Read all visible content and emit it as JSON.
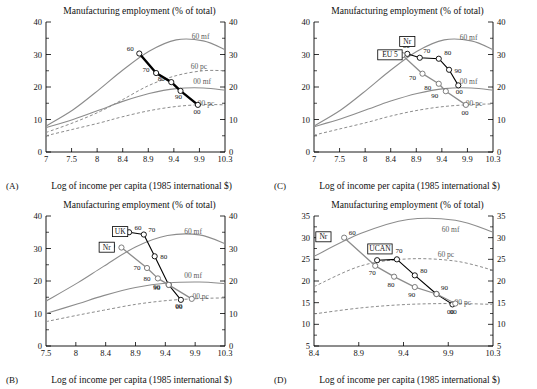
{
  "figure": {
    "panels": [
      {
        "id": "(A)",
        "title": "Manufacturing employment (% of total)",
        "xlabel": "Log of income per capita (1985 international $)",
        "xticks": [
          "7",
          "7.5",
          "8",
          "8.4",
          "8.9",
          "9.4",
          "9.9",
          "10.3"
        ],
        "yticks": [
          "0",
          "10",
          "20",
          "30",
          "40"
        ],
        "curve_labels": [
          "60 mf",
          "60 pc",
          "00 mf",
          "00 pc"
        ],
        "series_labels": [],
        "point_labels": [
          "60",
          "70",
          "80",
          "90",
          "00"
        ]
      },
      {
        "id": "(B)",
        "title": "Manufacturing employment (% of total)",
        "xlabel": "Log of income per capita (1985 international $)",
        "xticks": [
          "7.5",
          "8",
          "8.4",
          "8.9",
          "9.4",
          "9.9",
          "10.3"
        ],
        "yticks": [
          "0",
          "10",
          "20",
          "30",
          "40"
        ],
        "curve_labels": [
          "60 mf",
          "00 mf",
          "00 pc"
        ],
        "series_labels": [
          "UK",
          "Nr"
        ],
        "point_labels": [
          "60",
          "70",
          "80",
          "90",
          "00"
        ]
      },
      {
        "id": "(C)",
        "title": "Manufacturing employment (% of total)",
        "xlabel": "Log of income per capita (1985 international $)",
        "xticks": [
          "7",
          "7.5",
          "8",
          "8.4",
          "8.9",
          "9.4",
          "9.9",
          "10.3"
        ],
        "yticks": [
          "0",
          "10",
          "20",
          "30",
          "40"
        ],
        "curve_labels": [
          "60 mf",
          "00 mf",
          "00 pc"
        ],
        "series_labels": [
          "Nr",
          "EU 5"
        ],
        "point_labels": [
          "60",
          "70",
          "80",
          "90",
          "00"
        ]
      },
      {
        "id": "(D)",
        "title": "Manufacturing employment (% of total)",
        "xlabel": "Log of income per capita (1985 international $)",
        "xticks": [
          "8.4",
          "8.9",
          "9.4",
          "9.9",
          "10.3"
        ],
        "yticks": [
          "5",
          "10",
          "15",
          "20",
          "25",
          "30",
          "35"
        ],
        "curve_labels": [
          "60 mf",
          "60 pc",
          "00 pc"
        ],
        "series_labels": [
          "Nr",
          "UCAN"
        ],
        "point_labels": [
          "60",
          "70",
          "80",
          "90",
          "00"
        ]
      }
    ]
  },
  "chart_data": [
    {
      "type": "line",
      "panel": "(A)",
      "title": "Manufacturing employment (% of total)",
      "xlabel": "Log of income per capita (1985 international $)",
      "ylabel": "Manufacturing employment (% of total)",
      "xlim": [
        7,
        10.3
      ],
      "ylim": [
        0,
        40
      ],
      "grid": false,
      "legend": "inline-curve-labels",
      "reference_curves": [
        {
          "name": "60 mf",
          "style": "solid",
          "x": [
            7,
            7.5,
            8,
            8.4,
            8.9,
            9.4,
            9.9,
            10.3
          ],
          "y": [
            8.0,
            13.0,
            19.5,
            25.0,
            31.0,
            34.5,
            34.2,
            31.5
          ]
        },
        {
          "name": "60 pc",
          "style": "dashed",
          "x": [
            7,
            7.5,
            8,
            8.4,
            8.9,
            9.4,
            9.9,
            10.3
          ],
          "y": [
            6.0,
            9.0,
            12.5,
            16.0,
            20.5,
            23.5,
            25.0,
            25.0
          ]
        },
        {
          "name": "00 mf",
          "style": "solid",
          "x": [
            7,
            7.5,
            8,
            8.4,
            8.9,
            9.4,
            9.9,
            10.3
          ],
          "y": [
            7.5,
            10.0,
            13.0,
            15.5,
            18.0,
            19.5,
            19.7,
            19.0
          ]
        },
        {
          "name": "00 pc",
          "style": "dashed",
          "x": [
            7,
            7.5,
            8,
            8.4,
            8.9,
            9.4,
            9.9,
            10.3
          ],
          "y": [
            5.0,
            7.0,
            9.0,
            10.8,
            12.7,
            14.0,
            14.6,
            14.5
          ]
        }
      ],
      "series": [
        {
          "name": "main",
          "style": "thick-black",
          "x": [
            8.72,
            9.03,
            9.31,
            9.48,
            9.8
          ],
          "y": [
            30.3,
            24.3,
            21.5,
            18.8,
            14.5
          ],
          "labels": [
            "60",
            "70",
            "80",
            "90",
            "00"
          ]
        }
      ]
    },
    {
      "type": "line",
      "panel": "(B)",
      "title": "Manufacturing employment (% of total)",
      "xlabel": "Log of income per capita (1985 international $)",
      "ylabel": "Manufacturing employment (% of total)",
      "xlim": [
        7.5,
        10.3
      ],
      "ylim": [
        0,
        40
      ],
      "grid": false,
      "legend": "inline-curve-labels",
      "reference_curves": [
        {
          "name": "60 mf",
          "style": "solid",
          "x": [
            7.5,
            8,
            8.4,
            8.9,
            9.4,
            9.9,
            10.3
          ],
          "y": [
            13.8,
            19.5,
            24.5,
            30.5,
            34.0,
            34.2,
            31.5
          ]
        },
        {
          "name": "00 mf",
          "style": "solid",
          "x": [
            7.5,
            8,
            8.4,
            8.9,
            9.4,
            9.9,
            10.3
          ],
          "y": [
            10.0,
            13.0,
            15.5,
            18.0,
            19.4,
            19.7,
            19.2
          ]
        },
        {
          "name": "00 pc",
          "style": "dashed",
          "x": [
            7.5,
            8,
            8.4,
            8.9,
            9.4,
            9.9,
            10.3
          ],
          "y": [
            7.5,
            9.5,
            11.0,
            12.8,
            14.0,
            14.6,
            14.8
          ]
        }
      ],
      "series": [
        {
          "name": "UK",
          "style": "thick-black",
          "x": [
            8.8,
            9.03,
            9.2,
            9.42,
            9.61
          ],
          "y": [
            35.0,
            34.3,
            27.6,
            18.8,
            14.2
          ],
          "labels": [
            "60",
            "70",
            "80",
            "90",
            "00"
          ]
        },
        {
          "name": "Nr",
          "style": "gray",
          "x": [
            8.68,
            9.08,
            9.25,
            9.42,
            9.78
          ],
          "y": [
            30.3,
            24.0,
            20.8,
            18.8,
            14.5
          ],
          "labels": [
            "60",
            "70",
            "80",
            "90",
            "00"
          ]
        }
      ]
    },
    {
      "type": "line",
      "panel": "(C)",
      "title": "Manufacturing employment (% of total)",
      "xlabel": "Log of income per capita (1985 international $)",
      "ylabel": "Manufacturing employment (% of total)",
      "xlim": [
        7,
        10.3
      ],
      "ylim": [
        0,
        40
      ],
      "grid": false,
      "legend": "inline-curve-labels",
      "reference_curves": [
        {
          "name": "60 mf",
          "style": "solid",
          "x": [
            7,
            7.5,
            8,
            8.4,
            8.9,
            9.4,
            9.9,
            10.3
          ],
          "y": [
            8.0,
            13.0,
            19.5,
            25.0,
            31.0,
            34.5,
            34.2,
            31.5
          ]
        },
        {
          "name": "00 mf",
          "style": "solid",
          "x": [
            7,
            7.5,
            8,
            8.4,
            8.9,
            9.4,
            9.9,
            10.3
          ],
          "y": [
            7.8,
            10.2,
            13.2,
            15.6,
            18.0,
            19.5,
            19.7,
            19.0
          ]
        },
        {
          "name": "00 pc",
          "style": "dashed",
          "x": [
            7,
            7.5,
            8,
            8.4,
            8.9,
            9.4,
            9.9,
            10.3
          ],
          "y": [
            5.2,
            7.2,
            9.2,
            11.0,
            12.8,
            14.0,
            14.6,
            14.8
          ]
        }
      ],
      "series": [
        {
          "name": "Nr",
          "style": "thick-black",
          "x": [
            8.72,
            8.95,
            9.3,
            9.49,
            9.66
          ],
          "y": [
            30.2,
            29.0,
            28.7,
            25.3,
            20.5
          ],
          "labels": [
            "60",
            "70",
            "80",
            "90",
            "00"
          ]
        },
        {
          "name": "EU 5",
          "style": "gray",
          "x": [
            8.63,
            9.0,
            9.3,
            9.43,
            9.8
          ],
          "y": [
            29.8,
            24.1,
            21.0,
            18.7,
            14.5
          ],
          "labels": [
            "60",
            "70",
            "80",
            "90",
            "00"
          ]
        }
      ]
    },
    {
      "type": "line",
      "panel": "(D)",
      "title": "Manufacturing employment (% of total)",
      "xlabel": "Log of income per capita (1985 international $)",
      "ylabel": "Manufacturing employment (% of total)",
      "xlim": [
        8.4,
        10.3
      ],
      "ylim": [
        5,
        35
      ],
      "grid": false,
      "legend": "inline-curve-labels",
      "reference_curves": [
        {
          "name": "60 mf",
          "style": "solid",
          "x": [
            8.4,
            8.9,
            9.4,
            9.9,
            10.3
          ],
          "y": [
            25.7,
            31.0,
            34.2,
            34.0,
            31.3
          ]
        },
        {
          "name": "60 pc",
          "style": "dashed",
          "x": [
            8.4,
            8.9,
            9.4,
            9.9,
            10.3
          ],
          "y": [
            18.7,
            23.5,
            25.1,
            24.6,
            22.5
          ]
        },
        {
          "name": "00 pc",
          "style": "dashed",
          "x": [
            8.4,
            8.9,
            9.4,
            9.9,
            10.3
          ],
          "y": [
            12.4,
            13.8,
            14.6,
            14.8,
            14.6
          ]
        }
      ],
      "series": [
        {
          "name": "UCAN",
          "style": "thick-black",
          "x": [
            9.07,
            9.28,
            9.47,
            9.7,
            9.87
          ],
          "y": [
            24.8,
            25.0,
            21.3,
            17.0,
            14.6
          ],
          "labels": [
            "60",
            "70",
            "80",
            "90",
            "00"
          ]
        },
        {
          "name": "Nr",
          "style": "gray",
          "x": [
            8.72,
            9.05,
            9.25,
            9.47,
            9.7,
            9.9
          ],
          "y": [
            30.0,
            23.5,
            21.0,
            18.6,
            17.0,
            14.8
          ],
          "labels": [
            "60",
            "70",
            "80",
            "90",
            "",
            "00"
          ]
        }
      ]
    }
  ]
}
